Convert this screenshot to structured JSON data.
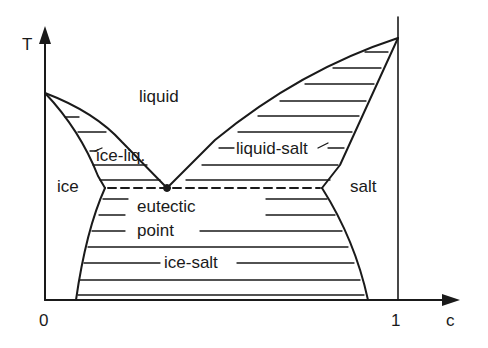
{
  "diagram": {
    "axes": {
      "y_label": "T",
      "x_label": "c",
      "x_tick_0": "0",
      "x_tick_1": "1"
    },
    "regions": {
      "liquid": "liquid",
      "ice_liq": "ice-liq.",
      "liquid_salt": "liquid-salt",
      "ice": "ice",
      "salt": "salt",
      "eutectic_1": "eutectic",
      "eutectic_2": "point",
      "ice_salt": "ice-salt"
    },
    "colors": {
      "line": "#1a1a1a",
      "background": "#ffffff"
    }
  }
}
